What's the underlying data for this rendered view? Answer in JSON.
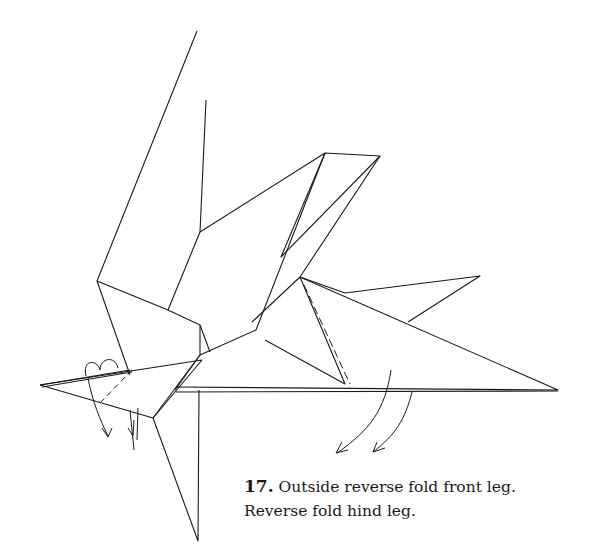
{
  "figure": {
    "step_number": "17.",
    "instruction_line1": "Outside reverse fold front leg.",
    "instruction_line2": "Reverse fold hind leg.",
    "colors": {
      "line": "#1a1a1a",
      "background": "#ffffff"
    },
    "symbols": [
      "outside-reverse-fold-arrow",
      "reverse-fold-arrow",
      "valley-fold-dashed-line",
      "push-arrow"
    ]
  }
}
